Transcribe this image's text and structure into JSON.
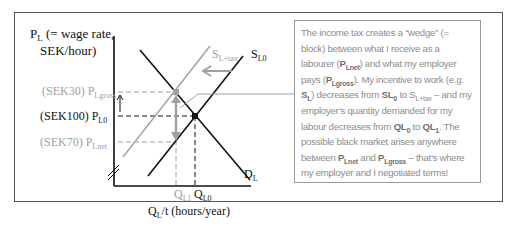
{
  "diagram": {
    "y_axis_label_line1": "P",
    "y_axis_label_sub": "L",
    "y_axis_label_rest1": " (= wage rate,",
    "y_axis_label_line2": "SEK/hour)",
    "x_axis_label_main": "Q",
    "x_axis_label_sub": "L",
    "x_axis_label_rest": "/t (hours/year)",
    "price_labels": [
      {
        "value": "(SEK30) P",
        "sub": "Lgross",
        "color": "#a0a0a0"
      },
      {
        "value": "(SEK100) P",
        "sub": "L0",
        "color": "#111111"
      },
      {
        "value": "(SEK70) P",
        "sub": "Lnet",
        "color": "#a0a0a0"
      }
    ],
    "quantity_labels": [
      {
        "value": "Q",
        "sub": "L1",
        "color": "#a0a0a0"
      },
      {
        "value": "Q",
        "sub": "L0",
        "color": "#111111"
      }
    ],
    "curves": {
      "supply_tax": {
        "label": "S",
        "sub": "L+tax",
        "color": "#a0a0a0"
      },
      "supply": {
        "label": "S",
        "sub": "L0",
        "color": "#111111"
      },
      "demand": {
        "label": "D",
        "sub": "L",
        "color": "#111111"
      }
    },
    "colors": {
      "black": "#111111",
      "grey": "#a0a0a0",
      "frame": "#555555"
    }
  },
  "note": {
    "t1": "The income tax creates a “wedge” (= block) between what I receive as a labourer (",
    "b1": "P",
    "b1s": "Lnet",
    "t2": ") and what my employer pays (",
    "b2": "P",
    "b2s": "Lgross",
    "t3": "). My incentive to work (e.g. ",
    "b3": "S",
    "b3s": "L",
    "t4": ") decreases from ",
    "b4": "SL",
    "b4s": "0",
    "t5": " to S",
    "t5s": "L+tax",
    "t6": " – and my employer’s quantity demanded for my labour decreases from ",
    "b5": "QL",
    "b5s": "0",
    "t7": " to ",
    "b6": "QL",
    "b6s": "1",
    "t8": ". The possible black market arises anywhere between ",
    "b7": "P",
    "b7s": "Lnet",
    "t9": " and ",
    "b8": "P",
    "b8s": "Lgross",
    "t10": " – that’s where my employer and I negotiated terms!"
  }
}
